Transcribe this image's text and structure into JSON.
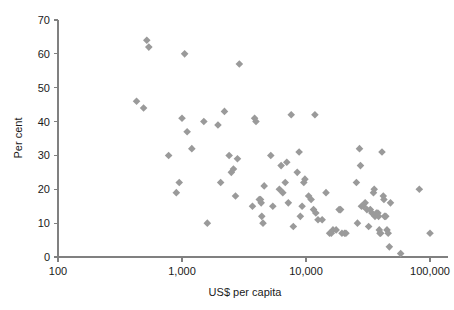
{
  "chart_data": {
    "type": "scatter",
    "title": "",
    "subtitle": "",
    "xlabel": "US$ per capita",
    "ylabel": "Per cent",
    "xscale": "log",
    "yscale": "linear",
    "xlim": [
      100,
      100000
    ],
    "ylim": [
      0,
      70
    ],
    "grid": false,
    "legend": null,
    "marker": {
      "shape": "diamond",
      "color": "#9a9a9a",
      "size": 6
    },
    "xticks": [
      100,
      1000,
      10000,
      100000
    ],
    "xticklabels": [
      "100",
      "1,000",
      "10,000",
      "100,000"
    ],
    "yticks": [
      0,
      10,
      20,
      30,
      40,
      50,
      60,
      70
    ],
    "yticklabels": [
      "0",
      "10",
      "20",
      "30",
      "40",
      "50",
      "60",
      "70"
    ],
    "series": [
      {
        "name": "countries",
        "points": [
          [
            430,
            46
          ],
          [
            490,
            44
          ],
          [
            520,
            64
          ],
          [
            540,
            62
          ],
          [
            780,
            30
          ],
          [
            900,
            19
          ],
          [
            950,
            22
          ],
          [
            1000,
            41
          ],
          [
            1050,
            60
          ],
          [
            1100,
            37
          ],
          [
            1200,
            32
          ],
          [
            1500,
            40
          ],
          [
            1600,
            10
          ],
          [
            1950,
            39
          ],
          [
            2050,
            22
          ],
          [
            2200,
            43
          ],
          [
            2400,
            30
          ],
          [
            2500,
            25
          ],
          [
            2600,
            26
          ],
          [
            2700,
            18
          ],
          [
            2800,
            29
          ],
          [
            2900,
            57
          ],
          [
            3700,
            15
          ],
          [
            3850,
            41
          ],
          [
            3950,
            40
          ],
          [
            4200,
            17
          ],
          [
            4300,
            17
          ],
          [
            4350,
            16
          ],
          [
            4400,
            12
          ],
          [
            4500,
            10
          ],
          [
            4600,
            21
          ],
          [
            5200,
            30
          ],
          [
            5400,
            15
          ],
          [
            6100,
            20
          ],
          [
            6300,
            27
          ],
          [
            6500,
            19
          ],
          [
            6800,
            22
          ],
          [
            7000,
            28
          ],
          [
            7200,
            16
          ],
          [
            7600,
            42
          ],
          [
            7900,
            9
          ],
          [
            8500,
            25
          ],
          [
            8800,
            31
          ],
          [
            9000,
            12
          ],
          [
            9300,
            15
          ],
          [
            9600,
            22
          ],
          [
            9800,
            23
          ],
          [
            10500,
            18
          ],
          [
            11000,
            17
          ],
          [
            11500,
            14
          ],
          [
            11800,
            42
          ],
          [
            12000,
            13
          ],
          [
            12500,
            11
          ],
          [
            13500,
            11
          ],
          [
            14500,
            19
          ],
          [
            15500,
            7
          ],
          [
            16000,
            7
          ],
          [
            16500,
            8
          ],
          [
            17500,
            8
          ],
          [
            18500,
            14
          ],
          [
            19000,
            14
          ],
          [
            19500,
            7
          ],
          [
            20500,
            7
          ],
          [
            21000,
            7
          ],
          [
            25500,
            22
          ],
          [
            26000,
            10
          ],
          [
            27000,
            32
          ],
          [
            27500,
            27
          ],
          [
            28000,
            15
          ],
          [
            29000,
            15
          ],
          [
            30000,
            16
          ],
          [
            31000,
            14
          ],
          [
            32000,
            9
          ],
          [
            33000,
            14
          ],
          [
            34000,
            13
          ],
          [
            35000,
            19
          ],
          [
            35500,
            20
          ],
          [
            36000,
            12
          ],
          [
            37000,
            13
          ],
          [
            38000,
            13
          ],
          [
            38500,
            12
          ],
          [
            39000,
            8
          ],
          [
            39500,
            7
          ],
          [
            40000,
            7
          ],
          [
            41000,
            31
          ],
          [
            42000,
            18
          ],
          [
            42500,
            17
          ],
          [
            43000,
            12
          ],
          [
            44000,
            12
          ],
          [
            45000,
            8
          ],
          [
            46000,
            7
          ],
          [
            47000,
            3
          ],
          [
            48000,
            16
          ],
          [
            58000,
            1
          ],
          [
            82000,
            20
          ],
          [
            100000,
            7
          ]
        ]
      }
    ]
  },
  "axes": {
    "x_title": "US$ per capita",
    "y_title": "Per cent"
  }
}
